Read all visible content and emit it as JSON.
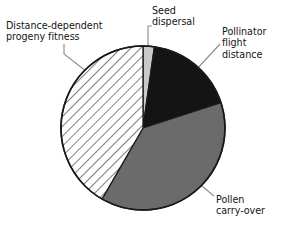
{
  "chart_data": {
    "type": "pie",
    "title": "",
    "subtitle": "",
    "xlabel": "",
    "ylabel": "",
    "grid": false,
    "legend_position": "callout-labels",
    "labels_outside": true,
    "start_angle_deg": 0,
    "direction": "clockwise",
    "categories": [
      "Seed dispersal",
      "Pollinator flight distance",
      "Pollen carry-over",
      "Distance-dependent progeny fitness"
    ],
    "values": [
      2,
      18,
      38,
      42
    ],
    "slices": [
      {
        "label": "Seed dispersal",
        "label_lines": "Seed\ndispersal",
        "value": 2,
        "start_deg": 0,
        "end_deg": 8,
        "fill": "#c9c9c9",
        "pattern": "solid"
      },
      {
        "label": "Pollinator flight distance",
        "label_lines": "Pollinator\nflight\ndistance",
        "value": 18,
        "start_deg": 8,
        "end_deg": 72,
        "fill": "#141414",
        "pattern": "solid"
      },
      {
        "label": "Pollen carry-over",
        "label_lines": "Pollen\ncarry-over",
        "value": 38,
        "start_deg": 72,
        "end_deg": 210,
        "fill": "#6b6b6b",
        "pattern": "solid"
      },
      {
        "label": "Distance-dependent progeny fitness",
        "label_lines": "Distance-dependent\nprogeny fitness",
        "value": 42,
        "start_deg": 210,
        "end_deg": 360,
        "fill": "#ffffff",
        "pattern": "diagonal-hatch"
      }
    ],
    "colors": {
      "seed_dispersal": "#c9c9c9",
      "pollinator_flight_distance": "#141414",
      "pollen_carry_over": "#6b6b6b",
      "distance_dependent_progeny_fitness": "#ffffff",
      "outline": "#1a1a1a",
      "leader_line": "#8a8a8a",
      "background": "#ffffff",
      "text": "#161616"
    },
    "geometry": {
      "center_x": 143,
      "center_y": 128,
      "radius": 82
    }
  },
  "labels": {
    "distance_dependent": "Distance-dependent\nprogeny fitness",
    "seed_dispersal": "Seed\ndispersal",
    "pollinator_flight": "Pollinator\nflight\ndistance",
    "pollen_carry_over": "Pollen\ncarry-over"
  }
}
